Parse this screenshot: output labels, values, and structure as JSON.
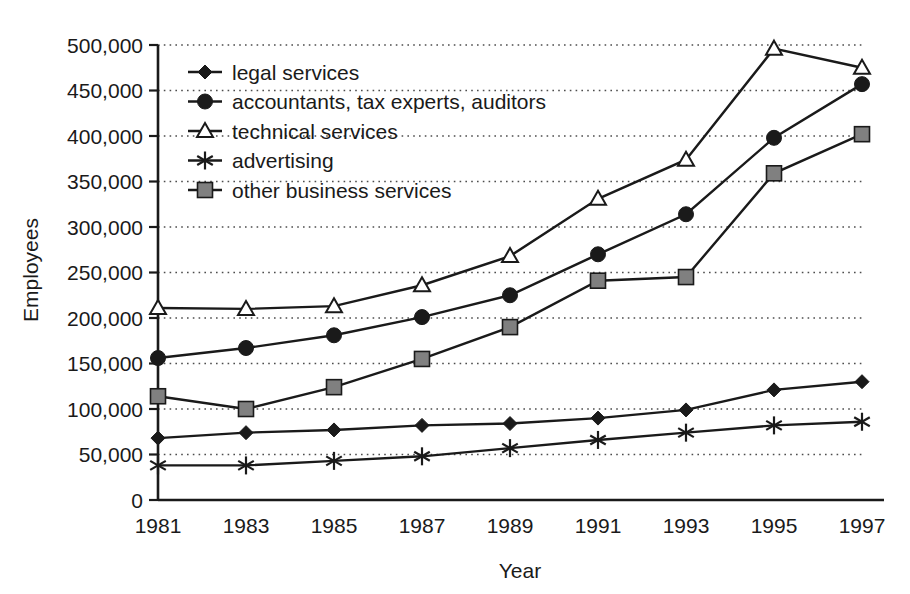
{
  "chart_data": {
    "type": "line",
    "title": "",
    "xlabel": "Year",
    "ylabel": "Employees",
    "categories": [
      "1981",
      "1983",
      "1985",
      "1987",
      "1989",
      "1991",
      "1993",
      "1995",
      "1997"
    ],
    "x": [
      1981,
      1983,
      1985,
      1987,
      1989,
      1991,
      1993,
      1995,
      1997
    ],
    "xlim": [
      1981,
      1997
    ],
    "ylim": [
      0,
      500000
    ],
    "ytick_labels": [
      "0",
      "50,000",
      "100,000",
      "150,000",
      "200,000",
      "250,000",
      "300,000",
      "350,000",
      "400,000",
      "450,000",
      "500,000"
    ],
    "yticks": [
      0,
      50000,
      100000,
      150000,
      200000,
      250000,
      300000,
      350000,
      400000,
      450000,
      500000
    ],
    "grid": "horizontal-dotted",
    "legend_position": "upper-left-inside",
    "series": [
      {
        "name": "legal services",
        "marker": "diamond",
        "color": "#1a1a1a",
        "values": [
          68000,
          74000,
          77000,
          82000,
          84000,
          90000,
          99000,
          121000,
          130000
        ]
      },
      {
        "name": "accountants, tax experts, auditors",
        "marker": "circle",
        "color": "#1a1a1a",
        "values": [
          156000,
          167000,
          181000,
          201000,
          225000,
          270000,
          314000,
          398000,
          457000
        ]
      },
      {
        "name": "technical services",
        "marker": "triangle-open",
        "color": "#1a1a1a",
        "values": [
          211000,
          210000,
          213000,
          236000,
          268000,
          331000,
          374000,
          496000,
          475000
        ]
      },
      {
        "name": "advertising",
        "marker": "asterisk",
        "color": "#1a1a1a",
        "values": [
          38000,
          38000,
          43000,
          48000,
          57000,
          66000,
          74000,
          82000,
          86000
        ]
      },
      {
        "name": "other business services",
        "marker": "square-filled",
        "color": "#808080",
        "values": [
          114000,
          100000,
          124000,
          155000,
          190000,
          241000,
          245000,
          359000,
          402000
        ]
      }
    ]
  },
  "legend": {
    "items": [
      {
        "label": "legal services",
        "marker": "diamond"
      },
      {
        "label": "accountants, tax experts, auditors",
        "marker": "circle"
      },
      {
        "label": "technical services",
        "marker": "triangle-open"
      },
      {
        "label": "advertising",
        "marker": "asterisk"
      },
      {
        "label": "other business services",
        "marker": "square-filled"
      }
    ]
  },
  "colors": {
    "axis": "#1a1a1a",
    "grid": "#4d4d4d",
    "line": "#1a1a1a",
    "square_fill": "#808080",
    "background": "#ffffff"
  }
}
